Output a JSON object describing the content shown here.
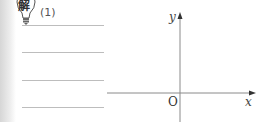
{
  "hint": {
    "icon": "lightbulb-icon",
    "icon_text": "解",
    "question_label": "(1)"
  },
  "answer_lines": [
    {
      "y": 25
    },
    {
      "y": 52
    },
    {
      "y": 80
    },
    {
      "y": 107
    }
  ],
  "graph": {
    "y_axis_label": "y",
    "x_axis_label": "x",
    "origin_label": "O",
    "axis_color": "#555555"
  }
}
